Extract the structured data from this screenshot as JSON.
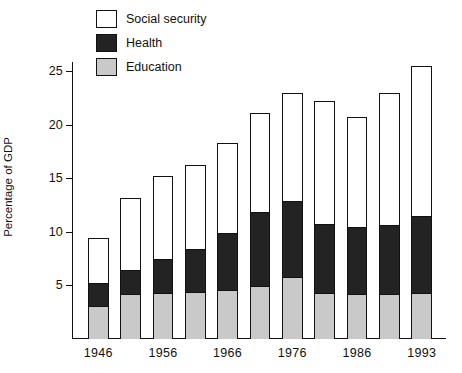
{
  "chart_data": {
    "type": "bar",
    "subtype": "stacked-vertical",
    "title": "",
    "xlabel": "",
    "ylabel": "Percentage of GDP",
    "ylim": [
      0,
      27
    ],
    "yticks": [
      5,
      10,
      15,
      20,
      25
    ],
    "ytick_labels": [
      "5",
      "10",
      "15",
      "20",
      "25"
    ],
    "grid": false,
    "legend_position": "top-left-inside",
    "categories": [
      "1946",
      "",
      "1956",
      "",
      "1966",
      "",
      "1976",
      "",
      "1986",
      "",
      "1993"
    ],
    "tick_labels_shown": [
      "1946",
      "1956",
      "1966",
      "1976",
      "1986",
      "1993"
    ],
    "series": [
      {
        "name": "Education",
        "color": "#c9c9c9",
        "values": [
          3.1,
          4.2,
          4.3,
          4.4,
          4.6,
          5.0,
          5.8,
          4.3,
          4.2,
          4.2,
          4.3
        ]
      },
      {
        "name": "Health",
        "color": "#232323",
        "values": [
          2.2,
          2.3,
          3.2,
          4.1,
          5.4,
          6.9,
          7.1,
          6.5,
          6.3,
          6.5,
          7.2
        ]
      },
      {
        "name": "Social security",
        "color": "#ffffff",
        "values": [
          4.1,
          6.7,
          7.7,
          7.8,
          8.3,
          9.2,
          10.1,
          11.4,
          10.2,
          12.3,
          14.0
        ]
      }
    ],
    "totals": [
      9.4,
      13.2,
      15.2,
      16.3,
      18.3,
      21.1,
      23.0,
      22.2,
      20.7,
      23.0,
      25.5
    ]
  },
  "legend": {
    "items": [
      {
        "label": "Social security",
        "swatch": "social",
        "icon": "legend-swatch-icon"
      },
      {
        "label": "Health",
        "swatch": "health",
        "icon": "legend-swatch-icon"
      },
      {
        "label": "Education",
        "swatch": "education",
        "icon": "legend-swatch-icon"
      }
    ]
  },
  "axes": {
    "y_title": "Percentage of GDP",
    "y_ticks": [
      "25",
      "20",
      "15",
      "10",
      "5"
    ],
    "x_ticks": [
      "1946",
      "",
      "1956",
      "",
      "1966",
      "",
      "1976",
      "",
      "1986",
      "",
      "1993"
    ]
  },
  "colors": {
    "education": "#c9c9c9",
    "health": "#232323",
    "social_security": "#ffffff",
    "axis": "#111111",
    "background": "#ffffff"
  }
}
